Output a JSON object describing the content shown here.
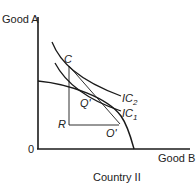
{
  "diagram": {
    "title": "Country II",
    "y_axis_label": "Good A",
    "x_axis_label": "Good B",
    "origin_label": "0",
    "points": {
      "C": "C",
      "Q_prime": "Q'",
      "R": "R",
      "O_prime": "O'"
    },
    "curves": {
      "ic2": {
        "base": "IC",
        "sub": "2"
      },
      "ic1": {
        "base": "IC",
        "sub": "1"
      },
      "ppf": "production possibilities frontier"
    },
    "colors": {
      "line": "#1a1a1a",
      "background": "#ffffff"
    }
  }
}
